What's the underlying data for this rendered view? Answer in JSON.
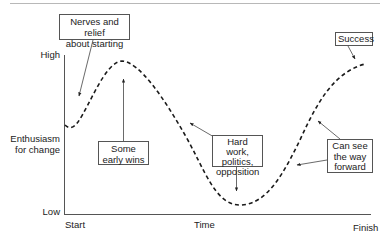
{
  "diagram": {
    "type": "change-curve",
    "y_axis": {
      "title_line1": "Enthusiasm",
      "title_line2": "for change",
      "high_label": "High",
      "low_label": "Low"
    },
    "x_axis": {
      "start_label": "Start",
      "middle_label": "Time",
      "end_label": "Finish"
    },
    "callouts": [
      {
        "id": "nerves",
        "line1": "Nerves and relief",
        "line2": "about starting"
      },
      {
        "id": "early-wins",
        "line1": "Some",
        "line2": "early wins"
      },
      {
        "id": "hard-work",
        "line1": "Hard work,",
        "line2": "politics,",
        "line3": "opposition"
      },
      {
        "id": "way-forward",
        "line1": "Can see",
        "line2": "the way",
        "line3": "forward"
      },
      {
        "id": "success",
        "line1": "Success"
      }
    ],
    "colors": {
      "axis": "#555555",
      "curve": "#1a1a1a",
      "text": "#222222",
      "box_border": "#555555"
    }
  }
}
